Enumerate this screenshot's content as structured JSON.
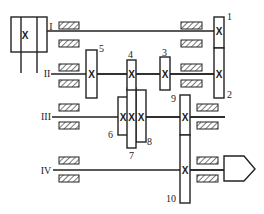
{
  "diagram": {
    "type": "gearbox-transmission-schematic",
    "shafts": [
      {
        "id": "I",
        "label": "I"
      },
      {
        "id": "II",
        "label": "II"
      },
      {
        "id": "III",
        "label": "III"
      },
      {
        "id": "IV",
        "label": "IV"
      }
    ],
    "gears": [
      {
        "id": "1",
        "label": "1",
        "shaft": "I"
      },
      {
        "id": "2",
        "label": "2",
        "shaft": "II"
      },
      {
        "id": "3",
        "label": "3",
        "shaft": "II"
      },
      {
        "id": "4",
        "label": "4",
        "shaft": "II"
      },
      {
        "id": "5",
        "label": "5",
        "shaft": "II"
      },
      {
        "id": "6",
        "label": "6",
        "shaft": "III"
      },
      {
        "id": "7",
        "label": "7",
        "shaft": "III"
      },
      {
        "id": "8",
        "label": "8",
        "shaft": "III"
      },
      {
        "id": "9",
        "label": "9",
        "shaft": "III"
      },
      {
        "id": "10",
        "label": "10",
        "shaft": "IV"
      }
    ],
    "gear_mark": "X",
    "colors": {
      "line": "#222222",
      "background": "#ffffff"
    }
  }
}
